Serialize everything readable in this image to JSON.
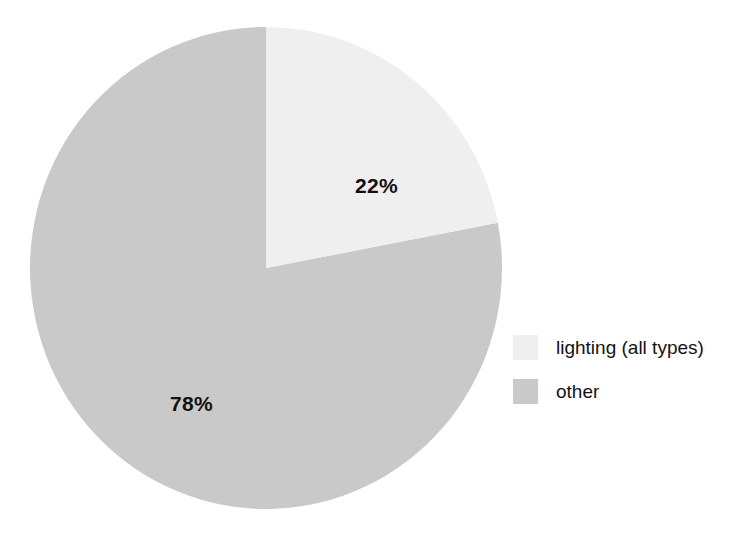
{
  "figure": {
    "title_fragment": "",
    "background_color": "#ffffff"
  },
  "chart_data": {
    "type": "pie",
    "title": "",
    "xlabel": "",
    "ylabel": "",
    "categories": [
      "lighting (all types)",
      "other"
    ],
    "values": [
      22,
      78
    ],
    "value_unit": "%",
    "data_labels": [
      "22%",
      "78%"
    ],
    "colors": [
      "#efefef",
      "#c9c9c9"
    ],
    "start_angle_deg": 0,
    "direction": "clockwise",
    "legend_position": "right",
    "grid": false
  },
  "labels": {
    "lighting": "22%",
    "other": "78%"
  },
  "legend": {
    "items": [
      {
        "label": "lighting (all types)",
        "color": "#efefef",
        "swatch_name": "legend-swatch-lighting"
      },
      {
        "label": "other",
        "color": "#c9c9c9",
        "swatch_name": "legend-swatch-other"
      }
    ]
  }
}
